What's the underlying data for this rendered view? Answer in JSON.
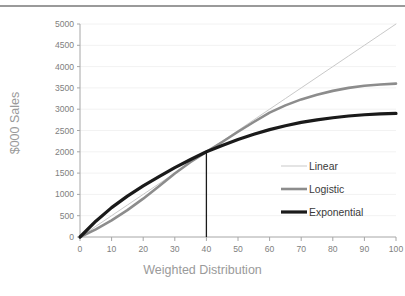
{
  "figure": {
    "top_rule_color": "#9a9a9a",
    "background": "#ffffff"
  },
  "chart_data": {
    "type": "line",
    "title": "",
    "subtitle": "",
    "xlabel": "Weighted Distribution",
    "ylabel": "$000 Sales",
    "xlim": [
      0,
      100
    ],
    "ylim": [
      0,
      5000
    ],
    "xticks": [
      0,
      10,
      20,
      30,
      40,
      50,
      60,
      70,
      80,
      90,
      100
    ],
    "yticks": [
      0,
      500,
      1000,
      1500,
      2000,
      2500,
      3000,
      3500,
      4000,
      4500,
      5000
    ],
    "xtick_labels": [
      "0",
      "10",
      "20",
      "30",
      "40",
      "50",
      "60",
      "70",
      "80",
      "90",
      "100"
    ],
    "ytick_labels": [
      "0",
      "500",
      "1000",
      "1500",
      "2000",
      "2500",
      "3000",
      "3500",
      "4000",
      "4500",
      "5000"
    ],
    "grid": true,
    "grid_axis": "y",
    "grid_color": "#f2f2f2",
    "axis_color": "#a6a6a6",
    "legend_position": "center-right",
    "x": [
      0,
      5,
      10,
      15,
      20,
      25,
      30,
      35,
      40,
      45,
      50,
      55,
      60,
      65,
      70,
      75,
      80,
      85,
      90,
      95,
      100
    ],
    "series": [
      {
        "name": "Linear",
        "color": "#c9c9c9",
        "width": 1.0,
        "values": [
          0,
          250,
          500,
          750,
          1000,
          1250,
          1500,
          1750,
          2000,
          2250,
          2500,
          2750,
          3000,
          3250,
          3500,
          3750,
          4000,
          4250,
          4500,
          4750,
          5000
        ]
      },
      {
        "name": "Logistic",
        "color": "#8c8c8c",
        "width": 2.6,
        "values": [
          0,
          180,
          390,
          630,
          900,
          1190,
          1490,
          1760,
          2000,
          2230,
          2470,
          2700,
          2920,
          3090,
          3230,
          3340,
          3430,
          3500,
          3550,
          3580,
          3600
        ]
      },
      {
        "name": "Exponential",
        "color": "#1a1a1a",
        "width": 3.2,
        "values": [
          0,
          370,
          690,
          960,
          1200,
          1420,
          1630,
          1820,
          2000,
          2150,
          2290,
          2410,
          2520,
          2610,
          2690,
          2750,
          2800,
          2840,
          2870,
          2890,
          2900
        ]
      }
    ],
    "annotations": [
      {
        "name": "intersection-dropline",
        "type": "vline",
        "x": 40,
        "y_from": 0,
        "y_to": 2000,
        "color": "#1a1a1a",
        "width": 1.3
      }
    ]
  },
  "legend": {
    "items": [
      {
        "label": "Linear"
      },
      {
        "label": "Logistic"
      },
      {
        "label": "Exponential"
      }
    ]
  }
}
